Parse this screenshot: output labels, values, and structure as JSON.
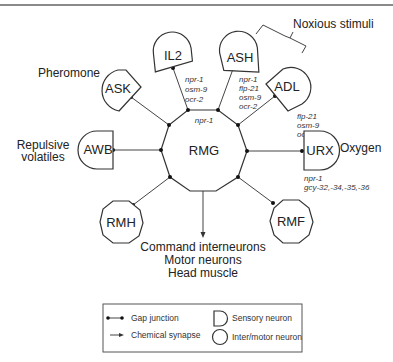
{
  "diagram": {
    "central_neuron": {
      "name": "RMG",
      "genes": [
        "npr-1"
      ]
    },
    "sensory_neurons": [
      {
        "id": "il2",
        "name": "IL2",
        "genes": [
          "npr-1",
          "osm-9",
          "ocr-2"
        ]
      },
      {
        "id": "ash",
        "name": "ASH",
        "genes": [
          "npr-1",
          "flp-21",
          "osm-9",
          "ocr-2"
        ]
      },
      {
        "id": "adl",
        "name": "ADL",
        "genes": [
          "flp-21",
          "osm-9",
          "ocr-2"
        ]
      },
      {
        "id": "ask",
        "name": "ASK",
        "genes": []
      },
      {
        "id": "awb",
        "name": "AWB",
        "genes": []
      },
      {
        "id": "urx",
        "name": "URX",
        "genes": [
          "npr-1",
          "gcy-32,-34,-35,-36"
        ]
      }
    ],
    "inter_motor_neurons": [
      {
        "id": "rmh",
        "name": "RMH"
      },
      {
        "id": "rmf",
        "name": "RMF"
      }
    ],
    "stimuli": {
      "noxious": "Noxious stimuli",
      "pheromone": "Pheromone",
      "repulsive_line1": "Repulsive",
      "repulsive_line2": "volatiles",
      "oxygen": "Oxygen"
    },
    "outputs": [
      "Command interneurons",
      "Motor neurons",
      "Head muscle"
    ],
    "legend": {
      "gap_junction": "Gap junction",
      "chemical_synapse": "Chemical synapse",
      "sensory_neuron": "Sensory neuron",
      "inter_motor_neuron": "Inter/motor neuron"
    }
  }
}
